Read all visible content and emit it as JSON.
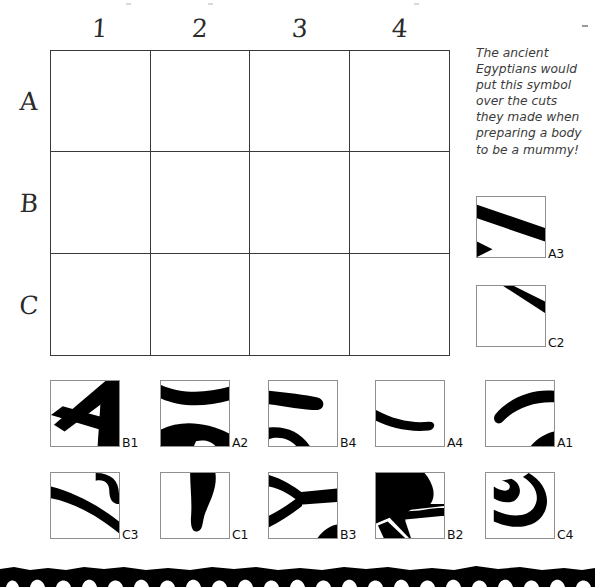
{
  "worksheet": {
    "type": "hidden-picture-grid-puzzle",
    "note": "The ancient Egyptians would put this symbol over the cuts they made when preparing a body to be a mummy!"
  },
  "grid": {
    "columns": [
      "1",
      "2",
      "3",
      "4"
    ],
    "rows": [
      "A",
      "B",
      "C"
    ],
    "cells": [
      {
        "id": "A1",
        "content": ""
      },
      {
        "id": "A2",
        "content": ""
      },
      {
        "id": "A3",
        "content": ""
      },
      {
        "id": "A4",
        "content": ""
      },
      {
        "id": "B1",
        "content": ""
      },
      {
        "id": "B2",
        "content": ""
      },
      {
        "id": "B3",
        "content": ""
      },
      {
        "id": "B4",
        "content": ""
      },
      {
        "id": "C1",
        "content": ""
      },
      {
        "id": "C2",
        "content": ""
      },
      {
        "id": "C3",
        "content": ""
      },
      {
        "id": "C4",
        "content": ""
      }
    ]
  },
  "side_tiles": [
    {
      "label": "A3"
    },
    {
      "label": "C2"
    }
  ],
  "tile_rows": [
    [
      {
        "label": "B1"
      },
      {
        "label": "A2"
      },
      {
        "label": "B4"
      },
      {
        "label": "A4"
      },
      {
        "label": "A1"
      }
    ],
    [
      {
        "label": "C3"
      },
      {
        "label": "C1"
      },
      {
        "label": "B3"
      },
      {
        "label": "B2"
      },
      {
        "label": "C4"
      }
    ]
  ],
  "colors": {
    "ink": "#000000",
    "grid_line": "#3a3a3a",
    "tile_border": "#8f8f8f",
    "note_text": "#3b3b3b"
  }
}
